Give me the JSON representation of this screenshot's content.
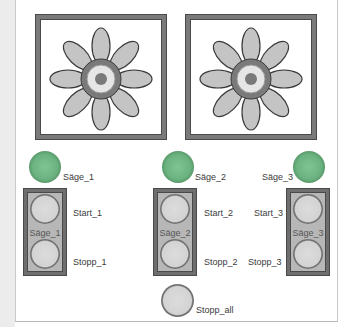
{
  "fans": [
    {
      "id": "fan-1",
      "icon": "fan-icon"
    },
    {
      "id": "fan-2",
      "icon": "fan-icon"
    }
  ],
  "saws": [
    {
      "lamp_label": "Säge_1",
      "group_label": "Säge_1",
      "start_label": "Start_1",
      "stop_label": "Stopp_1",
      "lamp_color": "#6ab27f"
    },
    {
      "lamp_label": "Säge_2",
      "group_label": "Säge_2",
      "start_label": "Start_2",
      "stop_label": "Stopp_2",
      "lamp_color": "#6ab27f"
    },
    {
      "lamp_label": "Säge_3",
      "group_label": "Säge_3",
      "start_label": "Start_3",
      "stop_label": "Stopp_3",
      "lamp_color": "#6ab27f"
    }
  ],
  "stop_all": {
    "label": "Stopp_all"
  },
  "colors": {
    "lamp_on": "#6ab27f",
    "button_face": "#d3d3d3",
    "frame": "#7a7a7a",
    "group_bg": "#b7b7b7"
  }
}
